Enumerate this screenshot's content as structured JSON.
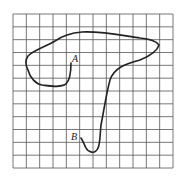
{
  "diagram": {
    "type": "curve-on-grid",
    "grid": {
      "columns": 12,
      "rows": 12,
      "line_color": "#555555"
    },
    "curve_color": "#222222",
    "labels": {
      "start": "A",
      "end": "B"
    },
    "caption": ""
  }
}
